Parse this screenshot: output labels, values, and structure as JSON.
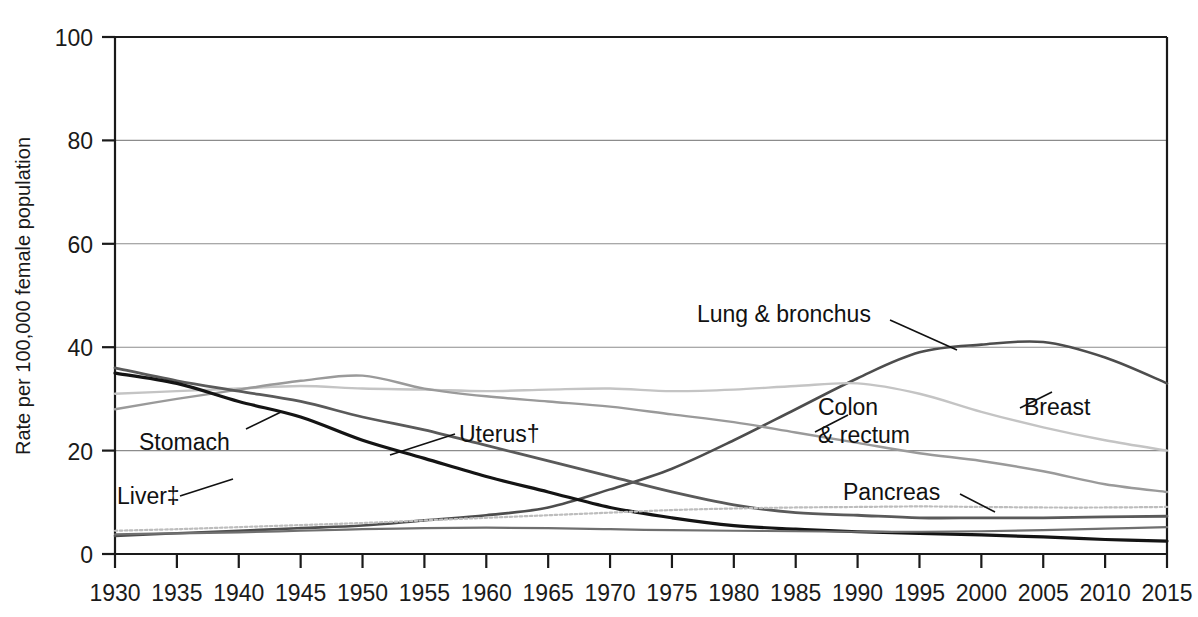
{
  "chart_data": {
    "type": "line",
    "title": "",
    "xlabel": "",
    "ylabel": "Rate per 100,000 female population",
    "xlim": [
      1930,
      2015
    ],
    "ylim": [
      0,
      100
    ],
    "yticks": [
      0,
      20,
      40,
      60,
      80,
      100
    ],
    "ytick_labels": [
      "0",
      "20",
      "40",
      "60",
      "80",
      "100"
    ],
    "xticks": [
      1930,
      1935,
      1940,
      1945,
      1950,
      1955,
      1960,
      1965,
      1970,
      1975,
      1980,
      1985,
      1990,
      1995,
      2000,
      2005,
      2010,
      2015
    ],
    "xtick_labels": [
      "1930",
      "1935",
      "1940",
      "1945",
      "1950",
      "1955",
      "1960",
      "1965",
      "1970",
      "1975",
      "1980",
      "1985",
      "1990",
      "1995",
      "2000",
      "2005",
      "2010",
      "2015"
    ],
    "grid": "horizontal",
    "legend_position": "inline-annotations",
    "x": [
      1930,
      1935,
      1940,
      1945,
      1950,
      1955,
      1960,
      1965,
      1970,
      1975,
      1980,
      1985,
      1990,
      1995,
      2000,
      2005,
      2010,
      2015
    ],
    "series": [
      {
        "name": "Lung & bronchus",
        "color": "#4d4d4d",
        "width": 2.6,
        "dash": "none",
        "values": [
          3.5,
          4.0,
          4.5,
          5.0,
          5.5,
          6.5,
          7.5,
          9.0,
          12.5,
          16.5,
          22.0,
          28.0,
          34.0,
          39.0,
          40.5,
          41.0,
          38.0,
          33.0
        ]
      },
      {
        "name": "Breast",
        "color": "#c4c4c4",
        "width": 2.4,
        "dash": "none",
        "values": [
          31.0,
          31.5,
          32.0,
          32.5,
          32.0,
          31.8,
          31.5,
          31.8,
          32.0,
          31.5,
          31.8,
          32.5,
          33.0,
          31.0,
          27.5,
          24.5,
          22.0,
          20.0
        ]
      },
      {
        "name": "Colon & rectum",
        "color": "#9a9a9a",
        "width": 2.4,
        "dash": "none",
        "values": [
          28.0,
          30.0,
          31.8,
          33.5,
          34.5,
          32.0,
          30.5,
          29.5,
          28.5,
          27.0,
          25.5,
          23.5,
          21.5,
          19.5,
          18.0,
          16.0,
          13.5,
          12.0
        ]
      },
      {
        "name": "Uterus†",
        "color": "#5a5a5a",
        "width": 2.8,
        "dash": "none",
        "values": [
          36.0,
          33.5,
          31.5,
          29.5,
          26.5,
          24.0,
          21.0,
          18.0,
          15.0,
          12.0,
          9.5,
          8.0,
          7.5,
          7.0,
          7.0,
          7.0,
          7.2,
          7.3
        ]
      },
      {
        "name": "Stomach",
        "color": "#141414",
        "width": 3.2,
        "dash": "none",
        "values": [
          35.0,
          33.0,
          29.5,
          26.5,
          22.0,
          18.5,
          15.0,
          12.0,
          9.0,
          7.0,
          5.5,
          4.8,
          4.3,
          4.0,
          3.7,
          3.3,
          2.8,
          2.5
        ]
      },
      {
        "name": "Pancreas",
        "color": "#bdbdbd",
        "width": 2.2,
        "dash": "dotted",
        "values": [
          4.5,
          4.8,
          5.2,
          5.6,
          6.0,
          6.5,
          7.0,
          7.5,
          8.0,
          8.5,
          8.8,
          9.0,
          9.1,
          9.2,
          9.1,
          9.0,
          9.0,
          9.1
        ]
      },
      {
        "name": "Liver‡",
        "color": "#6f6f6f",
        "width": 2.2,
        "dash": "none",
        "values": [
          3.8,
          4.0,
          4.2,
          4.5,
          4.8,
          5.0,
          5.1,
          5.0,
          4.8,
          4.6,
          4.5,
          4.4,
          4.3,
          4.3,
          4.4,
          4.6,
          4.9,
          5.2
        ]
      }
    ],
    "annotations": [
      {
        "name": "Lung & bronchus",
        "label": "Lung & bronchus"
      },
      {
        "name": "Breast",
        "label": "Breast"
      },
      {
        "name": "Colon & rectum",
        "label_line1": "Colon",
        "label_line2": "& rectum"
      },
      {
        "name": "Uterus",
        "label": "Uterus†"
      },
      {
        "name": "Stomach",
        "label": "Stomach"
      },
      {
        "name": "Pancreas",
        "label": "Pancreas"
      },
      {
        "name": "Liver",
        "label": "Liver‡"
      }
    ]
  }
}
